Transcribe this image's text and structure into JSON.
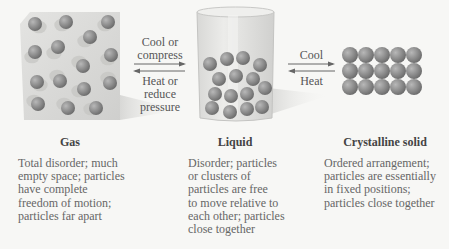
{
  "transitions": {
    "gas_liquid": {
      "forward_label_lines": [
        "Cool or",
        "compress"
      ],
      "reverse_label_lines": [
        "Heat or",
        "reduce",
        "pressure"
      ]
    },
    "liquid_solid": {
      "forward_label": "Cool",
      "reverse_label": "Heat"
    }
  },
  "states": [
    {
      "title": "Gas",
      "description_lines": [
        "Total disorder; much",
        "empty space; particles",
        "have complete",
        "freedom of motion;",
        "particles far apart"
      ]
    },
    {
      "title": "Liquid",
      "description_lines": [
        "Disorder; particles",
        "or clusters of",
        "particles are free",
        "to move relative to",
        "each other; particles",
        "close together"
      ]
    },
    {
      "title": "Crystalline solid",
      "description_lines": [
        "Ordered arrangement;",
        "particles are essentially",
        "in fixed positions;",
        "particles close together"
      ]
    }
  ],
  "colors": {
    "particle": "#8c8c8c",
    "box": "#d6d6d4",
    "background": "#f7f7f5",
    "text": "#555555"
  }
}
